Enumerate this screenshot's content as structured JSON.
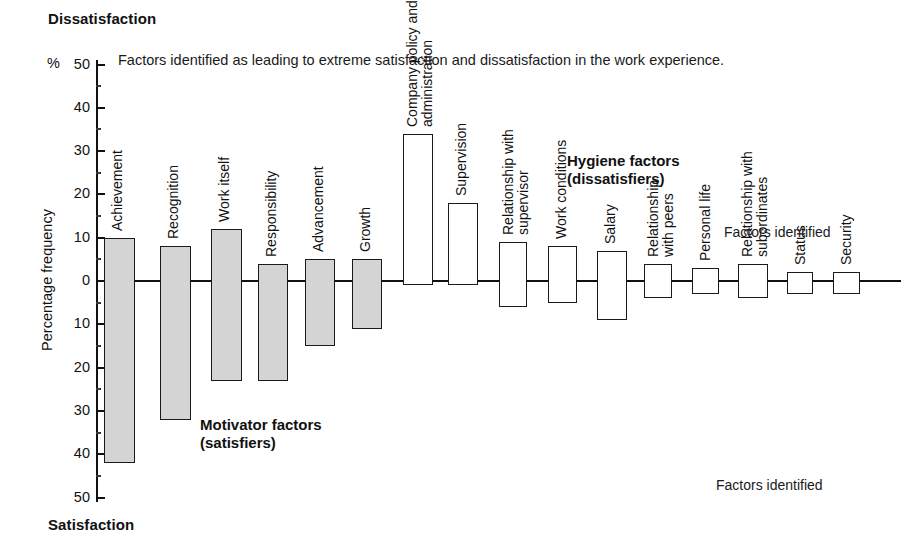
{
  "chart_data": {
    "type": "bar",
    "title": "Factors identified as leading to extreme satisfaction and dissatisfaction in the work experience.",
    "xlabel": "",
    "ylabel": "Percentage frequency",
    "unit": "%",
    "ylim": [
      -50,
      50
    ],
    "grid": false,
    "legend_position": "inline-annotations",
    "axis_top_label": "Dissatisfaction",
    "axis_bottom_label": "Satisfaction",
    "y_ticks_top": [
      "50",
      "40",
      "30",
      "20",
      "10",
      "0"
    ],
    "y_ticks_bottom": [
      "10",
      "20",
      "30",
      "40",
      "50"
    ],
    "categories": [
      "Achievement",
      "Recognition",
      "Work itself",
      "Responsibility",
      "Advancement",
      "Growth",
      "Company policy and administration",
      "Supervision",
      "Relationship with supervisor",
      "Work conditions",
      "Salary",
      "Relationship with peers",
      "Personal life",
      "Relationship with subordinates",
      "Status",
      "Security"
    ],
    "series": [
      {
        "name": "Dissatisfaction (above axis)",
        "values": [
          10,
          8,
          12,
          4,
          5,
          5,
          34,
          18,
          9,
          8,
          7,
          4,
          3,
          4,
          2,
          2
        ]
      },
      {
        "name": "Satisfaction (below axis)",
        "values": [
          -42,
          -32,
          -23,
          -23,
          -15,
          -11,
          -1,
          -1,
          -6,
          -5,
          -9,
          -4,
          -3,
          -4,
          -3,
          -3
        ]
      }
    ],
    "annotations": [
      "Motivator factors\n(satisfiers)",
      "Hygiene factors\n(dissatisfiers)",
      "Factors identified",
      "Factors identified"
    ]
  },
  "chart": {
    "caption": "Factors identified as leading to extreme satisfaction and dissatisfaction in the work experience.",
    "top_pole": "Dissatisfaction",
    "bottom_pole": "Satisfaction",
    "y_axis_title": "Percentage frequency",
    "percent_sign": "%",
    "motivator_annotation": "Motivator factors\n(satisfiers)",
    "hygiene_annotation": "Hygiene factors\n(dissatisfiers)",
    "factors_identified_top": "Factors identified",
    "factors_identified_bottom": "Factors identified",
    "colors": {
      "motivator_fill": "#d4d4d4",
      "hygiene_fill": "#ffffff",
      "stroke": "#1a1a1a",
      "text": "#111111",
      "background": "#ffffff"
    },
    "y_ticks": [
      {
        "label": "50",
        "value": 50
      },
      {
        "label": "40",
        "value": 40
      },
      {
        "label": "30",
        "value": 30
      },
      {
        "label": "20",
        "value": 20
      },
      {
        "label": "10",
        "value": 10
      },
      {
        "label": "0",
        "value": 0
      },
      {
        "label": "10",
        "value": -10
      },
      {
        "label": "20",
        "value": -20
      },
      {
        "label": "30",
        "value": -30
      },
      {
        "label": "40",
        "value": -40
      },
      {
        "label": "50",
        "value": -50
      }
    ],
    "bars": [
      {
        "label": "Achievement",
        "label_lines": [
          "Achievement"
        ],
        "up": 10,
        "down": -42,
        "group": "motivator",
        "x": 104,
        "w": 31
      },
      {
        "label": "Recognition",
        "label_lines": [
          "Recognition"
        ],
        "up": 8,
        "down": -32,
        "group": "motivator",
        "x": 160,
        "w": 31
      },
      {
        "label": "Work itself",
        "label_lines": [
          "Work itself"
        ],
        "up": 12,
        "down": -23,
        "group": "motivator",
        "x": 211,
        "w": 31
      },
      {
        "label": "Responsibility",
        "label_lines": [
          "Responsibility"
        ],
        "up": 4,
        "down": -23,
        "group": "motivator",
        "x": 258,
        "w": 30
      },
      {
        "label": "Advancement",
        "label_lines": [
          "Advancement"
        ],
        "up": 5,
        "down": -15,
        "group": "motivator",
        "x": 305,
        "w": 30
      },
      {
        "label": "Growth",
        "label_lines": [
          "Growth"
        ],
        "up": 5,
        "down": -11,
        "group": "motivator",
        "x": 352,
        "w": 30
      },
      {
        "label": "Company policy and administration",
        "label_lines": [
          "Company policy and",
          "administration"
        ],
        "up": 34,
        "down": -1,
        "group": "hygiene",
        "x": 403,
        "w": 30
      },
      {
        "label": "Supervision",
        "label_lines": [
          "Supervision"
        ],
        "up": 18,
        "down": -1,
        "group": "hygiene",
        "x": 448,
        "w": 30
      },
      {
        "label": "Relationship with supervisor",
        "label_lines": [
          "Relationship with",
          "supervisor"
        ],
        "up": 9,
        "down": -6,
        "group": "hygiene",
        "x": 499,
        "w": 28
      },
      {
        "label": "Work conditions",
        "label_lines": [
          "Work conditions"
        ],
        "up": 8,
        "down": -5,
        "group": "hygiene",
        "x": 548,
        "w": 29
      },
      {
        "label": "Salary",
        "label_lines": [
          "Salary"
        ],
        "up": 7,
        "down": -9,
        "group": "hygiene",
        "x": 597,
        "w": 30
      },
      {
        "label": "Relationship with peers",
        "label_lines": [
          "Relationship",
          "with peers"
        ],
        "up": 4,
        "down": -4,
        "group": "hygiene",
        "x": 644,
        "w": 28
      },
      {
        "label": "Personal life",
        "label_lines": [
          "Personal life"
        ],
        "up": 3,
        "down": -3,
        "group": "hygiene",
        "x": 692,
        "w": 27
      },
      {
        "label": "Relationship with subordinates",
        "label_lines": [
          "Relationship with",
          "subordinates"
        ],
        "up": 4,
        "down": -4,
        "group": "hygiene",
        "x": 738,
        "w": 30
      },
      {
        "label": "Status",
        "label_lines": [
          "Status"
        ],
        "up": 2,
        "down": -3,
        "group": "hygiene",
        "x": 787,
        "w": 26
      },
      {
        "label": "Security",
        "label_lines": [
          "Security"
        ],
        "up": 2,
        "down": -3,
        "group": "hygiene",
        "x": 833,
        "w": 27
      }
    ]
  }
}
